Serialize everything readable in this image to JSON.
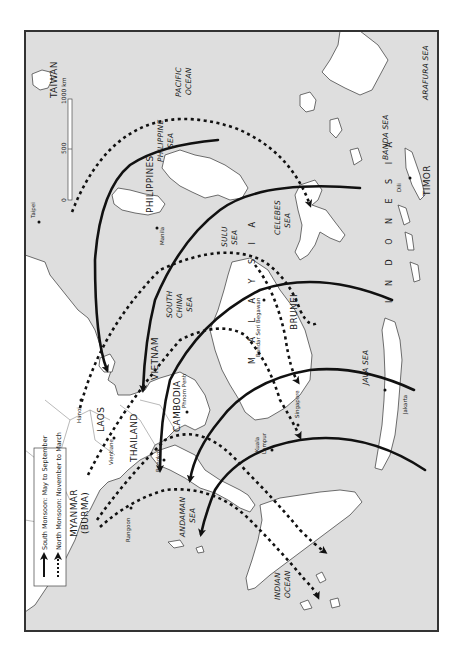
{
  "map": {
    "orientation": "rotated 90 degrees counter-clockwise (north points left)",
    "legend": {
      "items": [
        {
          "label": "South Monsoon: May to September",
          "line_style": "solid",
          "icon": "solid-arrow-icon"
        },
        {
          "label": "North Monsoon: November to March",
          "line_style": "dotted",
          "icon": "dotted-arrow-icon"
        }
      ]
    },
    "scale_bar": {
      "ticks": [
        "0",
        "500",
        "1000 km"
      ]
    },
    "countries": {
      "taiwan": "TAIWAN",
      "philippines": "PHILIPPINES",
      "vietnam": "VIETNAM",
      "laos": "LAOS",
      "thailand": "THAILAND",
      "cambodia": "CAMBODIA",
      "myanmar": "MYANMAR",
      "myanmar_alt": "(BURMA)",
      "malaysia": "M A L A Y S I A",
      "brunei": "BRUNEI",
      "indonesia": "I N D O N E S I A",
      "timor": "TIMOR"
    },
    "seas": {
      "pacific_1": "PACIFIC",
      "pacific_2": "OCEAN",
      "philippine_1": "PHILIPPINE",
      "philippine_2": "SEA",
      "south_china_1": "SOUTH",
      "south_china_2": "CHINA",
      "south_china_3": "SEA",
      "sulu_1": "SULU",
      "sulu_2": "SEA",
      "celebes_1": "CELEBES",
      "celebes_2": "SEA",
      "banda": "BANDA SEA",
      "arafura": "ARAFURA SEA",
      "java": "JAVA SEA",
      "andaman_1": "ANDAMAN",
      "andaman_2": "SEA",
      "indian_1": "INDIAN",
      "indian_2": "OCEAN"
    },
    "cities": {
      "taipei": "Taipei",
      "manila": "Manila",
      "hanoi": "Hanoi",
      "vientiane": "Vientiane",
      "bangkok": "Bangkok",
      "phnom_penh": "Phnom Penh",
      "bandar": "Bandar Seri Begawan",
      "singapore": "Singapore",
      "kuala_1": "Kuala",
      "kuala_2": "Lumpur",
      "rangoon": "Rangoon",
      "jakarta": "Jakarta",
      "dili": "Dili"
    },
    "colors": {
      "sea": "#dedede",
      "land": "#ffffff",
      "arrows": "#111111",
      "frame": "#333333"
    }
  }
}
